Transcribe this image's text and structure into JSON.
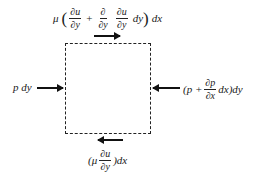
{
  "diagram": {
    "title": "",
    "element": "dashed control-volume square",
    "forces": {
      "top": {
        "direction": "right",
        "mu": "μ",
        "open_paren": "(",
        "term1_num": "∂u",
        "term1_den": "∂y",
        "plus": "+",
        "term2_op_num": "∂",
        "term2_op_den": "∂y",
        "term2_num": "∂u",
        "term2_den": "∂y",
        "term2_tail": "dy",
        "close_paren": ")",
        "tail": "dx",
        "full_text": "μ (∂u/∂y + ∂/∂y ∂u/∂y dy) dx"
      },
      "left": {
        "direction": "right",
        "text": "p dy"
      },
      "right": {
        "direction": "left",
        "head": "(p +",
        "frac_num": "∂p",
        "frac_den": "∂x",
        "tail": "dx)dy",
        "full_text": "(p + ∂p/∂x dx)dy"
      },
      "bottom": {
        "direction": "left",
        "head": "(μ",
        "frac_num": "∂u",
        "frac_den": "∂y",
        "tail": ")dx",
        "full_text": "(μ ∂u/∂y)dx"
      }
    },
    "colors": {
      "line": "#222222",
      "background": "#ffffff",
      "text": "#1a1a1a"
    }
  }
}
